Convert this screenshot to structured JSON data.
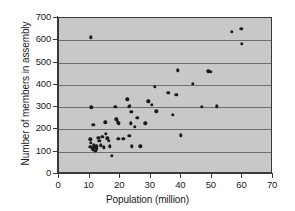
{
  "chart_data": {
    "type": "scatter",
    "title": "",
    "xlabel": "Population (million)",
    "ylabel": "Number of members in assembly",
    "xlim": [
      0,
      70
    ],
    "ylim": [
      0,
      700
    ],
    "xticks": [
      0,
      10,
      20,
      30,
      40,
      50,
      60,
      70
    ],
    "yticks": [
      0,
      100,
      200,
      300,
      400,
      500,
      600,
      700
    ],
    "grid": "horizontal",
    "legend": "none",
    "plot_background": "#c8c8c8",
    "marker_color": "#1a1a1a",
    "points": [
      [
        10.5,
        613
      ],
      [
        10.6,
        300
      ],
      [
        11.2,
        222
      ],
      [
        10.2,
        155
      ],
      [
        10.5,
        140
      ],
      [
        10.3,
        122
      ],
      [
        10.8,
        118
      ],
      [
        11.0,
        110
      ],
      [
        11.3,
        128
      ],
      [
        11.6,
        117
      ],
      [
        11.9,
        105
      ],
      [
        12.2,
        124
      ],
      [
        12.4,
        112
      ],
      [
        12.8,
        163
      ],
      [
        13.2,
        148
      ],
      [
        13.6,
        128
      ],
      [
        14.2,
        166
      ],
      [
        14.6,
        120
      ],
      [
        15.2,
        232
      ],
      [
        15.4,
        180
      ],
      [
        15.8,
        160
      ],
      [
        16.2,
        150
      ],
      [
        16.6,
        125
      ],
      [
        17.2,
        83
      ],
      [
        18.4,
        302
      ],
      [
        18.8,
        245
      ],
      [
        19.2,
        232
      ],
      [
        19.6,
        228
      ],
      [
        19.4,
        158
      ],
      [
        21.0,
        158
      ],
      [
        22.4,
        335
      ],
      [
        22.8,
        302
      ],
      [
        23.2,
        305
      ],
      [
        23.6,
        280
      ],
      [
        23.4,
        228
      ],
      [
        23.0,
        172
      ],
      [
        23.8,
        125
      ],
      [
        24.8,
        212
      ],
      [
        25.6,
        252
      ],
      [
        26.6,
        125
      ],
      [
        28.2,
        228
      ],
      [
        29.2,
        327
      ],
      [
        30.4,
        310
      ],
      [
        31.4,
        392
      ],
      [
        31.8,
        282
      ],
      [
        35.8,
        365
      ],
      [
        38.4,
        355
      ],
      [
        38.8,
        465
      ],
      [
        37.2,
        265
      ],
      [
        39.8,
        173
      ],
      [
        43.8,
        405
      ],
      [
        46.8,
        302
      ],
      [
        48.8,
        460
      ],
      [
        49.6,
        458
      ],
      [
        51.6,
        303
      ],
      [
        56.6,
        637
      ],
      [
        59.6,
        652
      ],
      [
        59.8,
        583
      ]
    ]
  }
}
